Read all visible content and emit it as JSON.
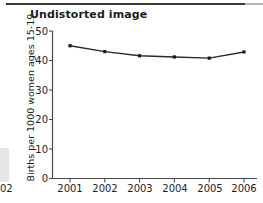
{
  "figure": {
    "title": "Undistorted image",
    "background": "#ffffff",
    "rule_color": "#3b3b3b"
  },
  "chart_data": {
    "type": "line",
    "title": "Undistorted image",
    "xlabel": "",
    "ylabel": "Births per 1000 women ages 15-19",
    "categories": [
      "2001",
      "2002",
      "2003",
      "2004",
      "2005",
      "2006"
    ],
    "x": [
      2001,
      2002,
      2003,
      2004,
      2005,
      2006
    ],
    "values": [
      45.0,
      43.0,
      41.6,
      41.2,
      40.8,
      42.9
    ],
    "series": [
      {
        "name": "Births per 1000 women ages 15-19",
        "values": [
          45.0,
          43.0,
          41.6,
          41.2,
          40.8,
          42.9
        ]
      }
    ],
    "ylim": [
      0,
      50
    ],
    "yticks": [
      0,
      10,
      20,
      30,
      40,
      50
    ],
    "ytick_labels": [
      "0",
      "10",
      "20",
      "30",
      "40",
      "50"
    ],
    "xtick_labels": [
      "2001",
      "2002",
      "2003",
      "2004",
      "2005",
      "2006"
    ],
    "grid": false,
    "legend": "none",
    "line_color": "#2b2b2b",
    "marker": "square",
    "marker_color": "#1a1a1a",
    "axis_color": "#4a4a4a"
  }
}
